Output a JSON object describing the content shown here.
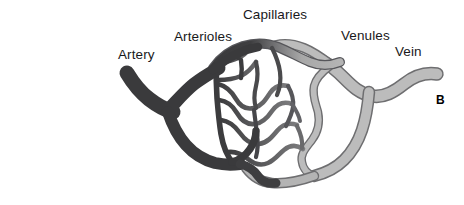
{
  "figure": {
    "panel_letter": "B",
    "title_visible": false,
    "background_color": "#ffffff",
    "width": 464,
    "height": 205
  },
  "labels": {
    "artery": "Artery",
    "arterioles": "Arterioles",
    "capillaries": "Capillaries",
    "venules": "Venules",
    "vein": "Vein"
  },
  "colors": {
    "artery_fill": "#3a3a3c",
    "arteriole_fill": "#3a3a3c",
    "capillary_outline": "#414144",
    "capillary_fill": "#ffffff",
    "venule_fill": "#b0b0b0",
    "vein_fill": "#b8b8b8",
    "vessel_outline": "#6e6e70",
    "text_color": "#19191b",
    "background": "#ffffff"
  },
  "structures": [
    {
      "name": "artery",
      "label": "Artery",
      "side": "arterial",
      "shade": "dark",
      "description": "Thick dark vessel entering from the left, forking into two arteriole trunks"
    },
    {
      "name": "arterioles",
      "label": "Arterioles",
      "side": "arterial",
      "shade": "dark",
      "description": "Branching dark vessels narrowing toward the capillary bed"
    },
    {
      "name": "capillaries",
      "label": "Capillaries",
      "side": "exchange",
      "shade": "outlined",
      "description": "Dense wavy network of thin interconnecting vessels in the center"
    },
    {
      "name": "venules",
      "label": "Venules",
      "side": "venous",
      "shade": "light",
      "description": "Light gray vessels converging from the capillary bed"
    },
    {
      "name": "vein",
      "label": "Vein",
      "side": "venous",
      "shade": "light",
      "description": "Thick light gray outlined vessel exiting to the right"
    }
  ]
}
